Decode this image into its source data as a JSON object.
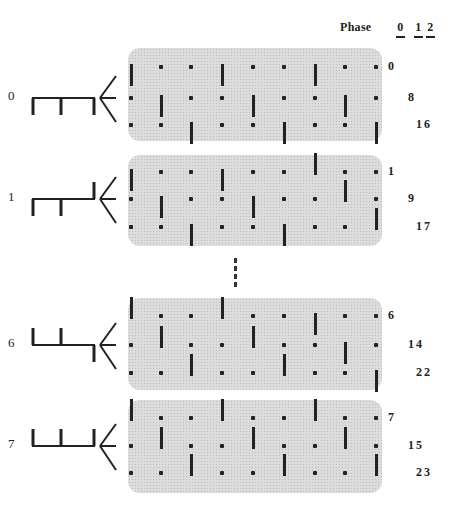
{
  "header": {
    "phase_label": "Phase",
    "phases": [
      "0",
      "1",
      "2"
    ]
  },
  "panels": [
    {
      "id": "0",
      "label": "0",
      "comb": [
        "down",
        "down",
        "down"
      ],
      "top": 48,
      "height": 93,
      "row_y": [
        67,
        98,
        125
      ],
      "row_labels": [
        "0",
        "8",
        "16"
      ],
      "bars": [
        {
          "row": 0,
          "cols": [
            0,
            3,
            6
          ],
          "dir": [
            "down",
            "down",
            "down"
          ]
        },
        {
          "row": 1,
          "cols": [
            1,
            4,
            7
          ],
          "dir": [
            "down",
            "down",
            "down"
          ]
        },
        {
          "row": 2,
          "cols": [
            2,
            5,
            8
          ],
          "dir": [
            "down",
            "down",
            "down"
          ]
        }
      ]
    },
    {
      "id": "1",
      "label": "1",
      "comb": [
        "down",
        "down",
        "up"
      ],
      "top": 155,
      "height": 91,
      "row_y": [
        172,
        199,
        227
      ],
      "row_labels": [
        "1",
        "9",
        "17"
      ],
      "bars": [
        {
          "row": 0,
          "cols": [
            0,
            3,
            6
          ],
          "dir": [
            "down",
            "down",
            "up"
          ]
        },
        {
          "row": 1,
          "cols": [
            1,
            4,
            7
          ],
          "dir": [
            "down",
            "down",
            "up"
          ]
        },
        {
          "row": 2,
          "cols": [
            2,
            5,
            8
          ],
          "dir": [
            "down",
            "down",
            "up"
          ]
        }
      ]
    },
    {
      "id": "6",
      "label": "6",
      "comb": [
        "up",
        "up",
        "down"
      ],
      "top": 298,
      "height": 92,
      "row_y": [
        316,
        345,
        373
      ],
      "row_labels": [
        "6",
        "14",
        "22"
      ],
      "bars": [
        {
          "row": 0,
          "cols": [
            0,
            3,
            6
          ],
          "dir": [
            "up",
            "up",
            "down"
          ]
        },
        {
          "row": 1,
          "cols": [
            1,
            4,
            7
          ],
          "dir": [
            "up",
            "up",
            "down"
          ]
        },
        {
          "row": 2,
          "cols": [
            2,
            5,
            8
          ],
          "dir": [
            "up",
            "up",
            "down"
          ]
        }
      ]
    },
    {
      "id": "7",
      "label": "7",
      "comb": [
        "up",
        "up",
        "up"
      ],
      "top": 400,
      "height": 93,
      "row_y": [
        418,
        446,
        473
      ],
      "row_labels": [
        "7",
        "15",
        "23"
      ],
      "bars": [
        {
          "row": 0,
          "cols": [
            0,
            3,
            6
          ],
          "dir": [
            "up",
            "up",
            "up"
          ]
        },
        {
          "row": 1,
          "cols": [
            1,
            4,
            7
          ],
          "dir": [
            "up",
            "up",
            "up"
          ]
        },
        {
          "row": 2,
          "cols": [
            2,
            5,
            8
          ],
          "dir": [
            "up",
            "up",
            "up"
          ]
        }
      ]
    }
  ],
  "column_x": [
    131,
    161,
    191,
    222,
    253,
    284,
    315,
    345,
    376
  ],
  "ellipsis": "vertical-dashes",
  "colors": {
    "ink": "#222222",
    "panel": "#dcdcdc"
  }
}
